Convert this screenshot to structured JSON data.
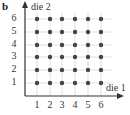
{
  "figure": {
    "panel_label": "b",
    "x_axis_label": "die 1",
    "y_axis_label": "die 2",
    "x_ticks": [
      "1",
      "2",
      "3",
      "4",
      "5",
      "6"
    ],
    "y_ticks": [
      "1",
      "2",
      "3",
      "4",
      "5",
      "6"
    ]
  },
  "chart_data": {
    "type": "scatter",
    "title": "",
    "xlabel": "die 1",
    "ylabel": "die 2",
    "x_ticks": [
      1,
      2,
      3,
      4,
      5,
      6
    ],
    "y_ticks": [
      1,
      2,
      3,
      4,
      5,
      6
    ],
    "grid": true,
    "points": [
      [
        1,
        1
      ],
      [
        2,
        1
      ],
      [
        3,
        1
      ],
      [
        4,
        1
      ],
      [
        5,
        1
      ],
      [
        6,
        1
      ],
      [
        1,
        2
      ],
      [
        2,
        2
      ],
      [
        3,
        2
      ],
      [
        4,
        2
      ],
      [
        5,
        2
      ],
      [
        6,
        2
      ],
      [
        1,
        3
      ],
      [
        2,
        3
      ],
      [
        3,
        3
      ],
      [
        4,
        3
      ],
      [
        5,
        3
      ],
      [
        6,
        3
      ],
      [
        1,
        4
      ],
      [
        2,
        4
      ],
      [
        3,
        4
      ],
      [
        4,
        4
      ],
      [
        5,
        4
      ],
      [
        6,
        4
      ],
      [
        1,
        5
      ],
      [
        2,
        5
      ],
      [
        3,
        5
      ],
      [
        4,
        5
      ],
      [
        5,
        5
      ],
      [
        6,
        5
      ],
      [
        1,
        6
      ],
      [
        2,
        6
      ],
      [
        3,
        6
      ],
      [
        4,
        6
      ],
      [
        5,
        6
      ],
      [
        6,
        6
      ]
    ]
  },
  "colors": {
    "axis": "#333333",
    "grid": "#d8d8d8",
    "point": "#444444"
  }
}
